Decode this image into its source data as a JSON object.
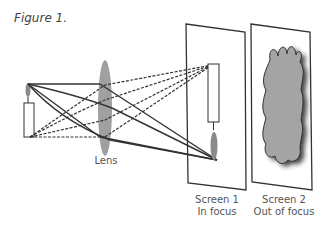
{
  "figure": {
    "title": "Figure 1.",
    "labels": {
      "lens": "Lens",
      "screen1_line1": "Screen 1",
      "screen1_line2": "In focus",
      "screen2_line1": "Screen 2",
      "screen2_line2": "Out of focus"
    },
    "elements": [
      {
        "name": "candle-object",
        "description": "Upright candle with flame"
      },
      {
        "name": "lens",
        "description": "Converging lens"
      },
      {
        "name": "screen-1",
        "description": "Screen with sharp inverted candle image"
      },
      {
        "name": "screen-2",
        "description": "Screen with blurred image"
      }
    ],
    "colors": {
      "line": "#333333",
      "lens": "#a0a0a0",
      "flame": "#8a8a8a",
      "blur": "#9a9a9a",
      "text": "#555555"
    }
  }
}
